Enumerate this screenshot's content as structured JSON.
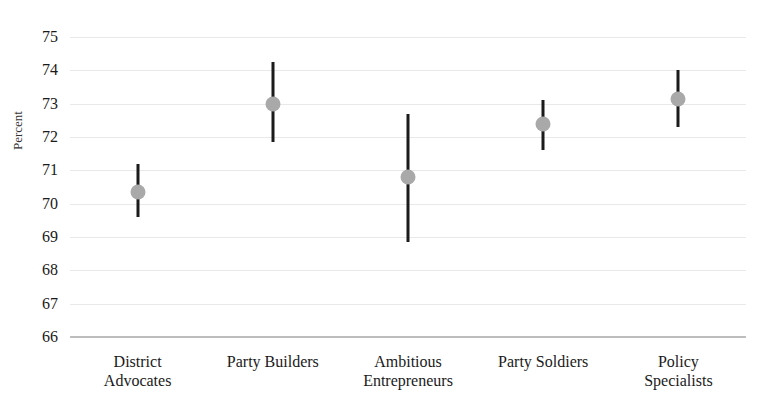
{
  "chart_data": {
    "type": "scatter",
    "title": "",
    "xlabel": "",
    "ylabel": "Percent",
    "ylim": [
      66,
      75
    ],
    "yticks": [
      75,
      74,
      73,
      72,
      71,
      70,
      69,
      68,
      67,
      66
    ],
    "grid": true,
    "legend": "none",
    "categories": [
      "District Advocates",
      "Party Builders",
      "Ambitious Entrepreneurs",
      "Party Soldiers",
      "Policy Specialists"
    ],
    "category_lines": [
      [
        "District",
        "Advocates"
      ],
      [
        "Party Builders",
        ""
      ],
      [
        "Ambitious",
        "Entrepreneurs"
      ],
      [
        "Party Soldiers",
        ""
      ],
      [
        "Policy",
        "Specialists"
      ]
    ],
    "values": [
      70.35,
      73.0,
      70.8,
      72.4,
      73.15
    ],
    "ci_low": [
      69.6,
      71.85,
      68.85,
      71.6,
      72.3
    ],
    "ci_high": [
      71.2,
      74.25,
      72.7,
      73.1,
      74.0
    ],
    "series": [
      {
        "name": "Percent",
        "points": [
          {
            "category": "District Advocates",
            "value": 70.35,
            "low": 69.6,
            "high": 71.2
          },
          {
            "category": "Party Builders",
            "value": 73.0,
            "low": 71.85,
            "high": 74.25
          },
          {
            "category": "Ambitious Entrepreneurs",
            "value": 70.8,
            "low": 68.85,
            "high": 72.7
          },
          {
            "category": "Party Soldiers",
            "value": 72.4,
            "low": 71.6,
            "high": 73.1
          },
          {
            "category": "Policy Specialists",
            "value": 73.15,
            "low": 72.3,
            "high": 74.0
          }
        ]
      }
    ],
    "colors": {
      "marker": "#a9a9a9",
      "error_bar": "#1b1b1b",
      "gridline": "#e9e9e9",
      "baseline": "#bdbdbd",
      "text": "#1a1a1a"
    }
  }
}
